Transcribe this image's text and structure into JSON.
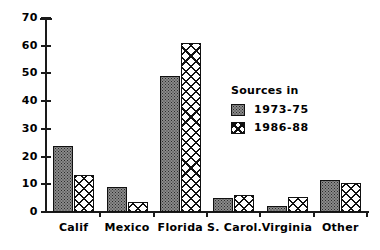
{
  "chart_data": {
    "type": "bar",
    "title": "",
    "xlabel": "",
    "ylabel": "",
    "ylim": [
      0,
      70
    ],
    "yticks": [
      0,
      10,
      20,
      30,
      40,
      50,
      60,
      70
    ],
    "grid": false,
    "legend_position": "inside-right",
    "legend_title": "Sources in",
    "categories": [
      "Calif",
      "Mexico",
      "Florida",
      "S. Carol.",
      "Virginia",
      "Other"
    ],
    "series": [
      {
        "name": "1973-75",
        "values": [
          24,
          9,
          49,
          5,
          2,
          11.5
        ]
      },
      {
        "name": "1986-88",
        "values": [
          13.5,
          3.5,
          61,
          6,
          5.5,
          10.3
        ]
      }
    ]
  },
  "legend": {
    "title": "Sources in",
    "entries": [
      {
        "label": "1973-75",
        "swatch": "stipple-gray-swatch"
      },
      {
        "label": "1986-88",
        "swatch": "crosshatch-swatch"
      }
    ]
  },
  "axes": {
    "y_tick_labels": [
      "70",
      "60",
      "50",
      "40",
      "30",
      "20",
      "10",
      "0"
    ],
    "x_tick_labels": [
      "Calif",
      "Mexico",
      "Florida",
      "S. Carol.",
      "Virginia",
      "Other"
    ]
  },
  "colors": {
    "series1_fill": "#8a8a8a",
    "series1_dot": "#2b2b2b",
    "series2_fill": "#ffffff",
    "series2_hatch": "#111111",
    "axis": "#1a1a1a",
    "background": "#ffffff"
  }
}
